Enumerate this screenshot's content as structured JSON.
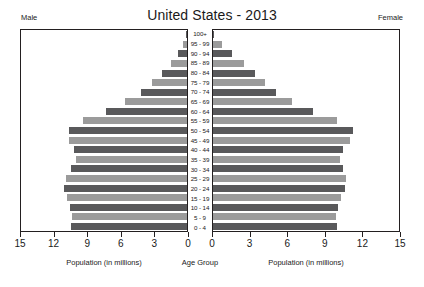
{
  "chart_data": {
    "type": "bar",
    "title": "United States - 2013",
    "subtitle": "",
    "orientation": "horizontal",
    "layout": "population-pyramid",
    "xlabel_left": "Population (in millions)",
    "xlabel_right": "Population (in millions)",
    "ylabel": "Age Group",
    "left_panel_label": "Male",
    "right_panel_label": "Female",
    "grid": false,
    "legend": "none",
    "xlim_left": [
      15,
      0
    ],
    "xlim_right": [
      0,
      15
    ],
    "xticks_left": [
      "15",
      "12",
      "9",
      "6",
      "3",
      "0"
    ],
    "xticks_right": [
      "0",
      "3",
      "6",
      "9",
      "12",
      "15"
    ],
    "xtick_values_left": [
      15,
      12,
      9,
      6,
      3,
      0
    ],
    "xtick_values_right": [
      0,
      3,
      6,
      9,
      12,
      15
    ],
    "categories": [
      "100+",
      "95 - 99",
      "90 - 94",
      "85 - 89",
      "80 - 84",
      "75 - 79",
      "70 - 74",
      "65 - 69",
      "60 - 64",
      "55 - 59",
      "50 - 54",
      "45 - 49",
      "40 - 44",
      "35 - 39",
      "30 - 34",
      "25 - 29",
      "20 - 24",
      "15 - 19",
      "10 - 14",
      "5 - 9",
      "0 - 4"
    ],
    "series": [
      {
        "name": "Male",
        "side": "left",
        "values": [
          0.06,
          0.35,
          0.78,
          1.45,
          2.25,
          3.1,
          4.15,
          5.55,
          7.25,
          9.3,
          10.55,
          10.55,
          10.1,
          9.95,
          10.35,
          10.8,
          11.0,
          10.75,
          10.45,
          10.25,
          10.35
        ]
      },
      {
        "name": "Female",
        "side": "right",
        "values": [
          0.1,
          0.7,
          1.55,
          2.5,
          3.35,
          4.15,
          5.05,
          6.3,
          7.95,
          9.9,
          11.2,
          10.95,
          10.4,
          10.15,
          10.4,
          10.6,
          10.55,
          10.25,
          10.0,
          9.8,
          9.9
        ]
      }
    ],
    "colors": {
      "bar_light": "#9b9b9b",
      "bar_dark": "#59595b",
      "axis": "#231f20",
      "text": "#1a1a1a",
      "background": "#ffffff"
    }
  }
}
